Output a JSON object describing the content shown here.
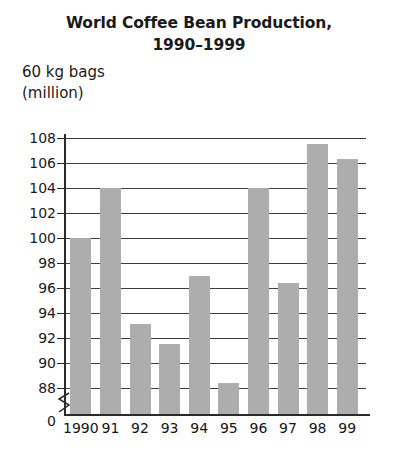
{
  "chart_data": {
    "type": "bar",
    "title": "World Coffee Bean Production, 1990–1999",
    "title_lines": [
      "World Coffee Bean Production,",
      "1990–1999"
    ],
    "ylabel": "60 kg bags (million)",
    "ylabel_lines": [
      "60 kg bags",
      "(million)"
    ],
    "xlabel": "",
    "categories": [
      "1990",
      "91",
      "92",
      "93",
      "94",
      "95",
      "96",
      "97",
      "98",
      "99"
    ],
    "values": [
      100,
      104,
      93.1,
      91.5,
      97,
      88.4,
      104,
      96.4,
      107.5,
      106.3
    ],
    "ylim": [
      88,
      108
    ],
    "y_ticks": [
      108,
      106,
      104,
      102,
      100,
      98,
      96,
      94,
      92,
      90,
      88
    ],
    "y_tick_labels": [
      "108",
      "106",
      "104",
      "102",
      "100",
      "98",
      "96",
      "94",
      "92",
      "90",
      "88"
    ],
    "zero_label": "0",
    "axis_break": true,
    "grid": true,
    "grid_axis": "y",
    "legend": null,
    "bar_color": "#adadad",
    "axis_color": "#2a2a2a",
    "background_color": "#ffffff"
  }
}
